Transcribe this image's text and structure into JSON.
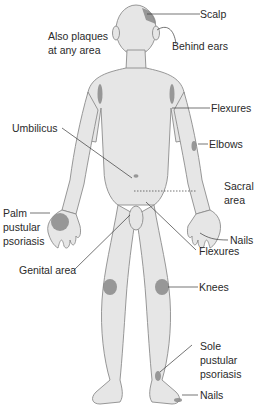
{
  "diagram": {
    "type": "anatomical-distribution",
    "colors": {
      "background": "#ffffff",
      "skin": "#e6e6e6",
      "outline": "#8c8c8c",
      "lesion": "#8a8a8a",
      "leader_line": "#3a3a3a",
      "text": "#2a2a2a"
    },
    "labels": {
      "scalp": "Scalp",
      "behind_ears": "Behind ears",
      "also_plaques_1": "Also plaques",
      "also_plaques_2": "at any area",
      "flexures_arm": "Flexures",
      "umbilicus": "Umbilicus",
      "elbows": "Elbows",
      "sacral_1": "Sacral",
      "sacral_2": "area",
      "palm_1": "Palm",
      "palm_2": "pustular",
      "palm_3": "psoriasis",
      "nails_hand": "Nails",
      "flexures_groin": "Flexures",
      "genital": "Genital area",
      "knees": "Knees",
      "sole_1": "Sole",
      "sole_2": "pustular",
      "sole_3": "psoriasis",
      "nails_foot": "Nails"
    }
  }
}
